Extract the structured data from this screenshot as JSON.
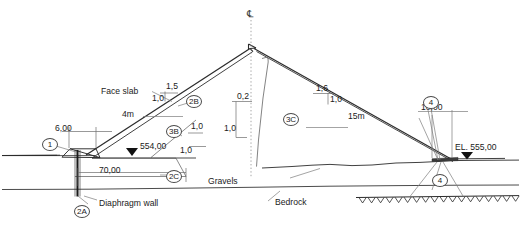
{
  "drawing": {
    "title": "Concrete face rockfill dam - typical cross section",
    "background": "#ffffff",
    "line_color": "#2b2b2b",
    "thin_line_color": "#9a9a9a",
    "text_color": "#1b1b1b",
    "fill_dark": "#3c3c3c"
  },
  "centerline": {
    "symbol": "℄",
    "label": "centerline-symbol"
  },
  "annotations": {
    "face_slab": "Face slab",
    "diaphragm_wall": "Diaphragm wall",
    "gravels": "Gravels",
    "bedrock": "Bedrock"
  },
  "dimensions": {
    "crest_width": "4m",
    "plinth_width": "6,00",
    "cutoff_length": "70,00",
    "upstream_water_level": "554,00",
    "downstream_toe_width": "10,00",
    "downstream_elevation": "EL. 555,00",
    "berm_width": "15m"
  },
  "slopes": {
    "upstream_run": "1,5",
    "upstream_rise": "1,0",
    "downstream_run": "1,6",
    "downstream_rise": "1,0",
    "core_run": "0,2",
    "core_rise": "1,0",
    "filter_run_upper": "1,0",
    "filter_rise_upper": "1,0",
    "filter_run_lower": "1,0"
  },
  "zones": [
    {
      "id": "1",
      "name": "zone-1-plinth"
    },
    {
      "id": "2A",
      "name": "zone-2a-diaphragm"
    },
    {
      "id": "2B",
      "name": "zone-2b-bedding"
    },
    {
      "id": "2C",
      "name": "zone-2c-transition"
    },
    {
      "id": "3B",
      "name": "zone-3b-rockfill"
    },
    {
      "id": "3C",
      "name": "zone-3c-rockfill"
    },
    {
      "id": "4",
      "name": "zone-4-toe-upper"
    },
    {
      "id": "4b",
      "name": "zone-4-toe-lower",
      "id_text": "4"
    }
  ]
}
